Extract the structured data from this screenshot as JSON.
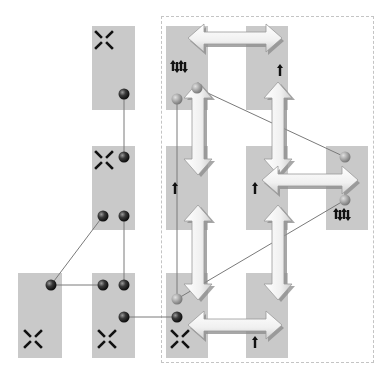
{
  "diagram": {
    "type": "module-connection-diagram",
    "colors": {
      "box_fill": "#c9c9c9",
      "frame_dash": "#c4c4c4",
      "connector_line": "#7a7a7a",
      "ball_dark": "#2e2e2e",
      "ball_light": "#9a9a9a",
      "double_arrow_fill": "#f4f4f4",
      "double_arrow_shadow": "#8a8a8a",
      "icon_color": "#111111"
    },
    "frame": {
      "x": 161,
      "y": 16,
      "w": 211,
      "h": 345
    },
    "boxes": [
      {
        "id": "left-top",
        "x": 92,
        "y": 26,
        "w": 43,
        "h": 84,
        "icon": "cross-arrows-icon",
        "icon_x": 104,
        "icon_y": 40
      },
      {
        "id": "left-middle",
        "x": 92,
        "y": 146,
        "w": 43,
        "h": 84,
        "icon": "cross-arrows-icon",
        "icon_x": 104,
        "icon_y": 160
      },
      {
        "id": "bottom-left",
        "x": 18,
        "y": 273,
        "w": 44,
        "h": 85,
        "icon": "cross-arrows-icon",
        "icon_x": 33,
        "icon_y": 339
      },
      {
        "id": "bottom-middle",
        "x": 92,
        "y": 273,
        "w": 43,
        "h": 85,
        "icon": "cross-arrows-icon",
        "icon_x": 107,
        "icon_y": 339
      },
      {
        "id": "grid-r1c1",
        "x": 166,
        "y": 26,
        "w": 42,
        "h": 84,
        "icon": "multi-arrows-icon",
        "icon_x": 180,
        "icon_y": 68
      },
      {
        "id": "grid-r1c2",
        "x": 246,
        "y": 26,
        "w": 42,
        "h": 84,
        "icon": "up-arrow-icon",
        "icon_x": 280,
        "icon_y": 70
      },
      {
        "id": "grid-r2c1",
        "x": 166,
        "y": 146,
        "w": 42,
        "h": 84,
        "icon": "up-arrow-icon",
        "icon_x": 175,
        "icon_y": 188
      },
      {
        "id": "grid-r2c2",
        "x": 246,
        "y": 146,
        "w": 42,
        "h": 84,
        "icon": "up-arrow-icon",
        "icon_x": 255,
        "icon_y": 188
      },
      {
        "id": "grid-r2c3",
        "x": 326,
        "y": 146,
        "w": 42,
        "h": 84,
        "icon": "multi-arrows-icon",
        "icon_x": 343,
        "icon_y": 216
      },
      {
        "id": "grid-r3c1",
        "x": 166,
        "y": 273,
        "w": 42,
        "h": 85,
        "icon": "cross-arrows-icon",
        "icon_x": 180,
        "icon_y": 339
      },
      {
        "id": "grid-r3c2",
        "x": 246,
        "y": 273,
        "w": 42,
        "h": 85,
        "icon": "up-arrow-icon",
        "icon_x": 255,
        "icon_y": 342
      }
    ],
    "balls": [
      {
        "id": "lt-out",
        "x": 124,
        "y": 94,
        "tone": "dark"
      },
      {
        "id": "lm-in",
        "x": 124,
        "y": 157,
        "tone": "dark"
      },
      {
        "id": "lm-out-a",
        "x": 103,
        "y": 216,
        "tone": "dark"
      },
      {
        "id": "lm-out-b",
        "x": 124,
        "y": 216,
        "tone": "dark"
      },
      {
        "id": "bl-port",
        "x": 51,
        "y": 285,
        "tone": "dark"
      },
      {
        "id": "bm-in-a",
        "x": 103,
        "y": 285,
        "tone": "dark"
      },
      {
        "id": "bm-in-b",
        "x": 124,
        "y": 285,
        "tone": "dark"
      },
      {
        "id": "bm-out",
        "x": 124,
        "y": 317,
        "tone": "dark"
      },
      {
        "id": "r1c1-a",
        "x": 177,
        "y": 99,
        "tone": "light"
      },
      {
        "id": "r1c1-b",
        "x": 197,
        "y": 88,
        "tone": "light"
      },
      {
        "id": "r2c3-a",
        "x": 345,
        "y": 157,
        "tone": "light"
      },
      {
        "id": "r2c3-b",
        "x": 345,
        "y": 200,
        "tone": "light"
      },
      {
        "id": "r3c1-a",
        "x": 177,
        "y": 299,
        "tone": "light"
      },
      {
        "id": "r3c1-b",
        "x": 177,
        "y": 317,
        "tone": "dark"
      }
    ],
    "connectors": [
      {
        "from": "lt-out",
        "to": "lm-in",
        "x1": 124,
        "y1": 94,
        "x2": 124,
        "y2": 157
      },
      {
        "from": "lm-out-a",
        "to": "bl-port",
        "x1": 103,
        "y1": 216,
        "x2": 51,
        "y2": 285
      },
      {
        "from": "lm-out-b",
        "to": "bm-in-b",
        "x1": 124,
        "y1": 216,
        "x2": 124,
        "y2": 285
      },
      {
        "from": "bl-port",
        "to": "bm-in-a",
        "x1": 51,
        "y1": 285,
        "x2": 103,
        "y2": 285
      },
      {
        "from": "bm-out",
        "to": "r3c1-b",
        "x1": 124,
        "y1": 317,
        "x2": 177,
        "y2": 317
      },
      {
        "from": "r1c1-a",
        "to": "r3c1-a",
        "x1": 177,
        "y1": 99,
        "x2": 177,
        "y2": 299
      },
      {
        "from": "r1c1-b",
        "to": "r2c3-a",
        "x1": 197,
        "y1": 88,
        "x2": 345,
        "y2": 157
      },
      {
        "from": "r2c3-b",
        "to": "r3c1-a",
        "x1": 345,
        "y1": 200,
        "x2": 177,
        "y2": 299
      }
    ],
    "double_arrows": [
      {
        "id": "h-top",
        "orientation": "horizontal",
        "x1": 188,
        "x2": 282,
        "y": 38
      },
      {
        "id": "v-left-1",
        "orientation": "vertical",
        "x": 198,
        "y1": 82,
        "y2": 175
      },
      {
        "id": "v-left-2",
        "orientation": "vertical",
        "x": 198,
        "y1": 205,
        "y2": 300
      },
      {
        "id": "v-mid-1",
        "orientation": "vertical",
        "x": 278,
        "y1": 82,
        "y2": 175
      },
      {
        "id": "v-mid-2",
        "orientation": "vertical",
        "x": 278,
        "y1": 205,
        "y2": 300
      },
      {
        "id": "h-mid",
        "orientation": "horizontal",
        "x1": 262,
        "x2": 358,
        "y": 180
      },
      {
        "id": "h-bottom",
        "orientation": "horizontal",
        "x1": 188,
        "x2": 282,
        "y": 325
      }
    ]
  }
}
